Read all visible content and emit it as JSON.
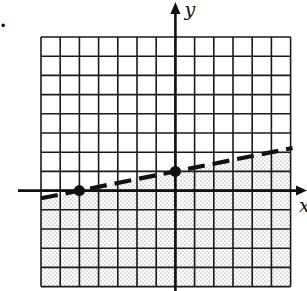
{
  "item_marker": ".",
  "chart_data": {
    "type": "line",
    "title": "",
    "xlabel": "x",
    "ylabel": "y",
    "xlim": [
      -7,
      6
    ],
    "ylim": [
      -5,
      8
    ],
    "grid": true,
    "grid_step": 1,
    "boundary": {
      "style": "dashed",
      "slope": 0.2,
      "intercept": 1,
      "equation": "y = (1/5)x + 1",
      "points": [
        {
          "x": -5,
          "y": 0
        },
        {
          "x": 0,
          "y": 1
        }
      ]
    },
    "shaded_region": "below",
    "inequality": "y < (1/5)x + 1",
    "marked_points": [
      {
        "x": -5,
        "y": 0
      },
      {
        "x": 0,
        "y": 1
      }
    ]
  },
  "style": {
    "line_color": "#111111",
    "grid_color": "#1a1a1a",
    "shade_dot_color": "#6e6e6e",
    "background": "#ffffff"
  }
}
